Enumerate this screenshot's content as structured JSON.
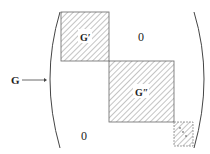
{
  "diagram": {
    "arrow_label": "G",
    "blocks": [
      {
        "id": "g-prime",
        "label": "G′"
      },
      {
        "id": "g-double-prime",
        "label": "G″"
      },
      {
        "id": "g-dots",
        "label": "·"
      }
    ],
    "zero_upper": "0",
    "zero_lower": "0",
    "colors": {
      "line": "#555555",
      "hatch": "#777777",
      "text": "#222222"
    }
  }
}
